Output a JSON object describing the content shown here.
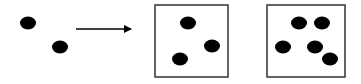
{
  "diagram": {
    "colors": {
      "background": "#ffffff",
      "ink": "#000000",
      "frame": "#333333"
    },
    "loose_dots": [
      {
        "cx": 28,
        "cy": 23
      },
      {
        "cx": 60,
        "cy": 47
      }
    ],
    "arrow": {
      "x1": 76,
      "y1": 29,
      "x2": 131,
      "y2": 29
    },
    "boxes": [
      {
        "name": "box-three-dots",
        "x": 155,
        "y": 5,
        "w": 73,
        "h": 72,
        "dots": [
          {
            "cx": 188,
            "cy": 23
          },
          {
            "cx": 212,
            "cy": 46
          },
          {
            "cx": 180,
            "cy": 59
          }
        ]
      },
      {
        "name": "box-five-dots",
        "x": 267,
        "y": 5,
        "w": 78,
        "h": 72,
        "dots": [
          {
            "cx": 299,
            "cy": 23
          },
          {
            "cx": 322,
            "cy": 23
          },
          {
            "cx": 283,
            "cy": 47
          },
          {
            "cx": 315,
            "cy": 47
          },
          {
            "cx": 330,
            "cy": 59
          }
        ]
      }
    ]
  }
}
